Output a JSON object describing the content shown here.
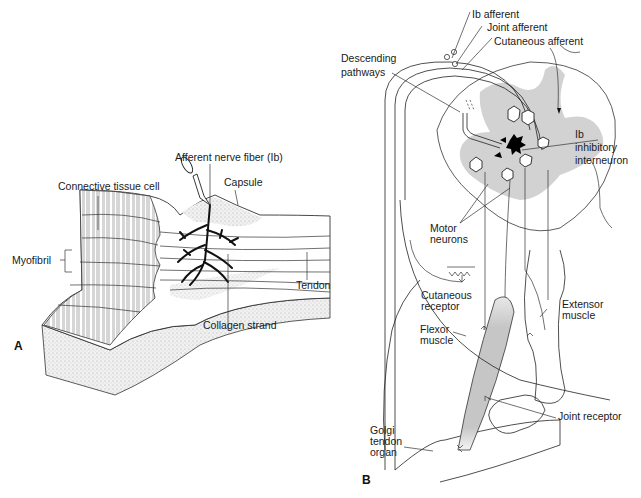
{
  "panels": [
    {
      "id": "A",
      "letter": "A",
      "title": "Golgi tendon organ structure",
      "labels": {
        "afferent": "Afferent nerve fiber (Ib)",
        "connective": "Connective tissue cell",
        "capsule": "Capsule",
        "myofibril": "Myofibril",
        "tendon": "Tendon",
        "collagen": "Collagen strand"
      }
    },
    {
      "id": "B",
      "letter": "B",
      "title": "Ib inhibitory reflex circuit",
      "labels": {
        "ib_afferent": "Ib afferent",
        "joint_afferent": "Joint afferent",
        "cutaneous_afferent": "Cutaneous afferent",
        "descending_1": "Descending",
        "descending_2": "pathways",
        "ib_1": "Ib",
        "ib_2": "inhibitory",
        "ib_3": "interneuron",
        "motor_1": "Motor",
        "motor_2": "neurons",
        "cut_rec_1": "Cutaneous",
        "cut_rec_2": "receptor",
        "extensor_1": "Extensor",
        "extensor_2": "muscle",
        "flexor_1": "Flexor",
        "flexor_2": "muscle",
        "joint_receptor": "Joint receptor",
        "golgi_1": "Golgi",
        "golgi_2": "tendon",
        "golgi_3": "organ"
      }
    }
  ],
  "colors": {
    "gray_matter": "#d4d4d4",
    "muscle_fill": "#c9c9c9",
    "ink": "#1a1a1a"
  }
}
